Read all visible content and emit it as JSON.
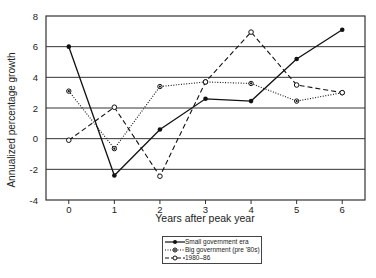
{
  "chart_data": {
    "type": "line",
    "title": "",
    "xlabel": "Years after peak year",
    "ylabel": "Annualized percentage growth",
    "x": [
      0,
      1,
      2,
      3,
      4,
      5,
      6
    ],
    "xticks": [
      "0",
      "1",
      "2",
      "3",
      "4",
      "5",
      "6"
    ],
    "yticks": [
      "-4",
      "-2",
      "0",
      "2",
      "4",
      "6",
      "8"
    ],
    "ylim": [
      -4,
      8
    ],
    "xlim": [
      -0.5,
      6.5
    ],
    "grid": "horizontal",
    "legend_position": "below",
    "series": [
      {
        "name": "Small government era",
        "style": "solid",
        "marker": "filled-circle",
        "values": [
          6.0,
          -2.4,
          0.6,
          2.6,
          2.45,
          5.2,
          7.1
        ]
      },
      {
        "name": "Big government (pre '80s)",
        "style": "dotted",
        "marker": "filled-circle-small",
        "values": [
          3.1,
          -0.65,
          3.4,
          3.7,
          3.6,
          2.45,
          3.0
        ]
      },
      {
        "name": "1980–86",
        "style": "dashed",
        "marker": "open-circle",
        "values": [
          -0.1,
          2.05,
          -2.45,
          3.7,
          6.95,
          3.5,
          3.0
        ]
      }
    ]
  },
  "axes": {
    "xlabel": "Years after peak year",
    "ylabel": "Annualized percentage growth"
  },
  "legend": {
    "items": [
      {
        "label": "Small government era"
      },
      {
        "label": "Big government (pre '80s)"
      },
      {
        "label": "1980–86"
      }
    ]
  }
}
